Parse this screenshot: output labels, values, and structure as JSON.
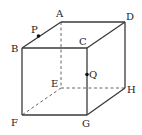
{
  "figure": {
    "type": "cube",
    "vertices": [
      "A",
      "B",
      "C",
      "D",
      "E",
      "F",
      "G",
      "H"
    ],
    "visible_edges": [
      [
        "A",
        "B"
      ],
      [
        "A",
        "D"
      ],
      [
        "B",
        "C"
      ],
      [
        "C",
        "D"
      ],
      [
        "B",
        "F"
      ],
      [
        "C",
        "G"
      ],
      [
        "D",
        "H"
      ],
      [
        "F",
        "G"
      ],
      [
        "G",
        "H"
      ]
    ],
    "hidden_edges": [
      [
        "A",
        "E"
      ],
      [
        "E",
        "F"
      ],
      [
        "E",
        "H"
      ]
    ],
    "points": [
      {
        "label": "P",
        "on_edge": [
          "A",
          "B"
        ]
      },
      {
        "label": "Q",
        "on_edge": [
          "C",
          "G"
        ]
      }
    ],
    "labels": {
      "A": "A",
      "B": "B",
      "C": "C",
      "D": "D",
      "E": "E",
      "F": "F",
      "G": "G",
      "H": "H",
      "P": "P",
      "Q": "Q"
    }
  }
}
